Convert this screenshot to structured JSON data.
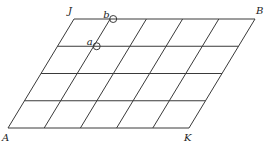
{
  "diagram": {
    "type": "parallelogram-grid",
    "rows": 4,
    "columns": 5,
    "corner_labels": {
      "top_left": "J",
      "top_right": "B",
      "bottom_left": "A",
      "bottom_right": "K"
    },
    "points": [
      {
        "label": "b",
        "grid_col": 1,
        "grid_row": 0
      },
      {
        "label": "a",
        "grid_col": 1,
        "grid_row": 1
      }
    ],
    "line_color": "#3a3a3a"
  }
}
